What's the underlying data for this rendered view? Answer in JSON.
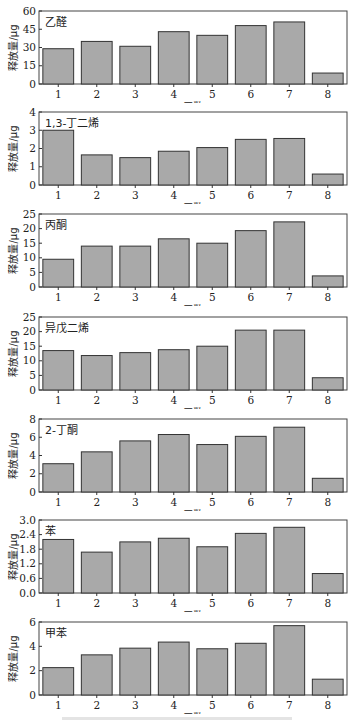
{
  "figure": {
    "ylabel": "释放量/μg",
    "xlabel": "口数",
    "bar_fill": "#a9a9a9",
    "bar_stroke": "#333333",
    "frame_color": "#444444"
  },
  "chart_data": [
    {
      "type": "bar",
      "title": "乙醛",
      "categories": [
        "1",
        "2",
        "3",
        "4",
        "5",
        "6",
        "7",
        "8"
      ],
      "values": [
        29,
        35,
        31,
        43,
        40,
        48,
        51,
        9
      ],
      "xlabel": "口数",
      "ylabel": "释放量/μg",
      "ylim": [
        0,
        60
      ],
      "yticks": [
        "0",
        "15",
        "30",
        "45",
        "60"
      ],
      "grid": false,
      "legend": null
    },
    {
      "type": "bar",
      "title": "1,3-丁二烯",
      "categories": [
        "1",
        "2",
        "3",
        "4",
        "5",
        "6",
        "7",
        "8"
      ],
      "values": [
        3.0,
        1.65,
        1.5,
        1.85,
        2.05,
        2.5,
        2.55,
        0.6
      ],
      "xlabel": "口数",
      "ylabel": "释放量/μg",
      "ylim": [
        0,
        4
      ],
      "yticks": [
        "0",
        "1",
        "2",
        "3",
        "4"
      ],
      "grid": false,
      "legend": null
    },
    {
      "type": "bar",
      "title": "丙酮",
      "categories": [
        "1",
        "2",
        "3",
        "4",
        "5",
        "6",
        "7",
        "8"
      ],
      "values": [
        9.5,
        14,
        14,
        16.5,
        15,
        19.3,
        22.3,
        3.8
      ],
      "xlabel": "口数",
      "ylabel": "释放量/μg",
      "ylim": [
        0,
        25
      ],
      "yticks": [
        "0",
        "5",
        "10",
        "15",
        "20",
        "25"
      ],
      "grid": false,
      "legend": null
    },
    {
      "type": "bar",
      "title": "异戊二烯",
      "categories": [
        "1",
        "2",
        "3",
        "4",
        "5",
        "6",
        "7",
        "8"
      ],
      "values": [
        13.5,
        11.8,
        12.8,
        13.8,
        15,
        20.5,
        20.5,
        4.2
      ],
      "xlabel": "口数",
      "ylabel": "释放量/μg",
      "ylim": [
        0,
        25
      ],
      "yticks": [
        "0",
        "5",
        "10",
        "15",
        "20",
        "25"
      ],
      "grid": false,
      "legend": null
    },
    {
      "type": "bar",
      "title": "2-丁酮",
      "categories": [
        "1",
        "2",
        "3",
        "4",
        "5",
        "6",
        "7",
        "8"
      ],
      "values": [
        3.1,
        4.4,
        5.6,
        6.3,
        5.2,
        6.1,
        7.1,
        1.5
      ],
      "xlabel": "口数",
      "ylabel": "释放量/μg",
      "ylim": [
        0,
        8
      ],
      "yticks": [
        "0",
        "2",
        "4",
        "6",
        "8"
      ],
      "grid": false,
      "legend": null
    },
    {
      "type": "bar",
      "title": "苯",
      "categories": [
        "1",
        "2",
        "3",
        "4",
        "5",
        "6",
        "7",
        "8"
      ],
      "values": [
        2.2,
        1.68,
        2.1,
        2.25,
        1.9,
        2.45,
        2.7,
        0.8
      ],
      "xlabel": "口数",
      "ylabel": "释放量/μg",
      "ylim": [
        0,
        3.0
      ],
      "yticks": [
        "0.0",
        "0.6",
        "1.2",
        "1.8",
        "2.4",
        "3.0"
      ],
      "grid": false,
      "legend": null
    },
    {
      "type": "bar",
      "title": "甲苯",
      "categories": [
        "1",
        "2",
        "3",
        "4",
        "5",
        "6",
        "7",
        "8"
      ],
      "values": [
        2.25,
        3.3,
        3.85,
        4.35,
        3.8,
        4.25,
        5.7,
        1.3
      ],
      "xlabel": "口数",
      "ylabel": "释放量/μg",
      "ylim": [
        0,
        6
      ],
      "yticks": [
        "0",
        "2",
        "4",
        "6"
      ],
      "grid": false,
      "legend": null
    }
  ],
  "layout": {
    "panel_tops": [
      0,
      101,
      203,
      306,
      408,
      509,
      611
    ],
    "panel_height": 103
  }
}
